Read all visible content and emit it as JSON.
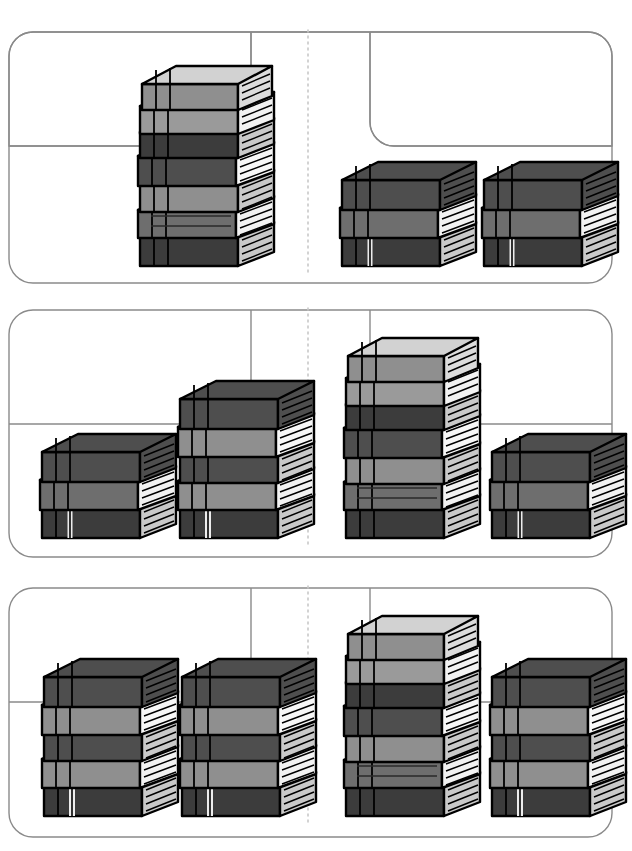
{
  "page": {
    "width": 621,
    "height": 851,
    "background": "#ffffff"
  },
  "style": {
    "card_border": "#8a8a8a",
    "card_fill": "#ffffff",
    "divider": "#cfcfcf",
    "ink": "#000000",
    "cover_light": "#d2d2d2",
    "cover_mid": "#9a9a9a",
    "cover_dark": "#4e4e4e",
    "cover_darker": "#3c3c3c",
    "spine_light": "#bdbdbd",
    "spine_mid": "#8f8f8f",
    "spine_dark": "#454545",
    "pages_white": "#f7f7f7",
    "pages_gray": "#b9b9b9",
    "band_white": "#ededed"
  },
  "cards": [
    {
      "name": "row-1",
      "y": 18,
      "height": 266,
      "divider_x": 300,
      "left_group": {
        "label": "left-group",
        "stacks": [
          {
            "name": "stack-7",
            "count": 7,
            "x": 118,
            "baseline": 252,
            "scale": 1.0
          }
        ],
        "total": 7
      },
      "right_group": {
        "label": "right-group",
        "stacks": [
          {
            "name": "stack-3-a",
            "count": 3,
            "x": 320,
            "baseline": 252,
            "scale": 1.0
          },
          {
            "name": "stack-3-b",
            "count": 3,
            "x": 462,
            "baseline": 252,
            "scale": 1.0
          }
        ],
        "total": 6
      },
      "comparison": "greater-left"
    },
    {
      "name": "row-2",
      "y": 296,
      "height": 262,
      "divider_x": 300,
      "left_group": {
        "label": "left-group",
        "stacks": [
          {
            "name": "stack-3",
            "count": 3,
            "x": 20,
            "baseline": 528,
            "scale": 1.0
          },
          {
            "name": "stack-5",
            "count": 5,
            "x": 158,
            "baseline": 528,
            "scale": 1.0
          }
        ],
        "total": 8
      },
      "right_group": {
        "label": "right-group",
        "stacks": [
          {
            "name": "stack-7",
            "count": 7,
            "x": 324,
            "baseline": 528,
            "scale": 1.0
          },
          {
            "name": "stack-3",
            "count": 3,
            "x": 470,
            "baseline": 528,
            "scale": 1.0
          }
        ],
        "total": 10
      },
      "comparison": "greater-right"
    },
    {
      "name": "row-3",
      "y": 574,
      "height": 264,
      "divider_x": 300,
      "left_group": {
        "label": "left-group",
        "stacks": [
          {
            "name": "stack-5-a",
            "count": 5,
            "x": 22,
            "baseline": 812,
            "scale": 1.0
          },
          {
            "name": "stack-5-b",
            "count": 5,
            "x": 160,
            "baseline": 812,
            "scale": 1.0
          }
        ],
        "total": 10
      },
      "right_group": {
        "label": "right-group",
        "stacks": [
          {
            "name": "stack-7",
            "count": 7,
            "x": 324,
            "baseline": 812,
            "scale": 1.0
          },
          {
            "name": "stack-5",
            "count": 5,
            "x": 470,
            "baseline": 812,
            "scale": 1.0
          }
        ],
        "total": 12
      },
      "comparison": "greater-right"
    }
  ],
  "book_palette": {
    "cover_tones": [
      "#d2d2d2",
      "#9a9a9a",
      "#4e4e4e",
      "#3c3c3c",
      "#6e6e6e"
    ],
    "pages_tones": [
      "#f7f7f7",
      "#c9c9c9"
    ],
    "sequence_7": [
      "light",
      "mid",
      "dark",
      "dark",
      "mid",
      "mid",
      "dark"
    ],
    "sequence_5": [
      "dark",
      "mid",
      "dark",
      "mid",
      "dark"
    ],
    "sequence_3": [
      "dark",
      "mid",
      "dark"
    ]
  }
}
